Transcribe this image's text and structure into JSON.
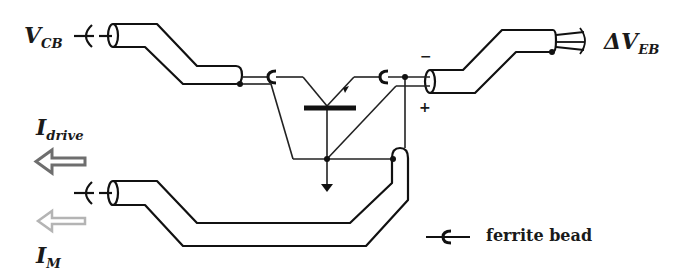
{
  "labels": {
    "vcb": {
      "main": "V",
      "sub": "CB"
    },
    "veb": {
      "main": "ΔV",
      "sub": "EB"
    },
    "idrive": {
      "main": "I",
      "sub": "drive"
    },
    "im": {
      "main": "I",
      "sub": "M"
    }
  },
  "polarity": {
    "minus": "−",
    "plus": "+"
  },
  "legend": {
    "ferrite_bead": "ferrite bead"
  },
  "colors": {
    "line": "#111111",
    "idrive_arrow": "#6e6e6e",
    "im_arrow": "#b4b4b4"
  }
}
